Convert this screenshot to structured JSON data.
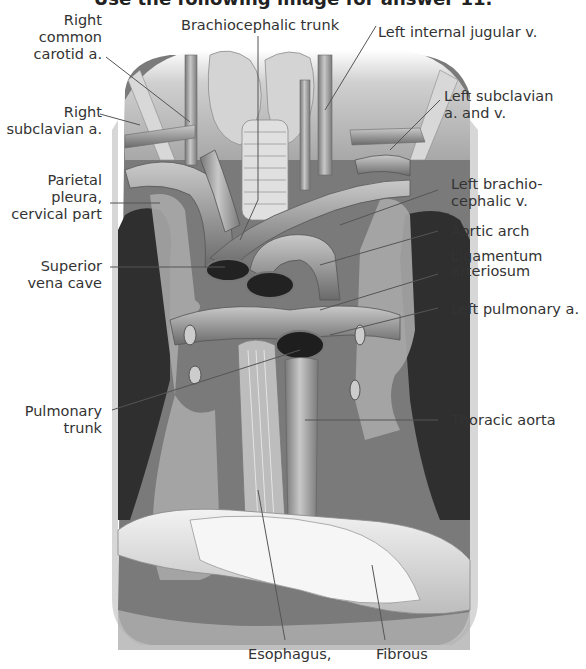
{
  "header": {
    "text": "Use the following image for answer 11."
  },
  "figure": {
    "labels_left": [
      {
        "id": "right-common-carotid",
        "lines": [
          "Right",
          "common",
          "carotid a."
        ]
      },
      {
        "id": "right-subclavian",
        "lines": [
          "Right",
          "subclavian a."
        ]
      },
      {
        "id": "parietal-pleura",
        "lines": [
          "Parietal",
          "pleura,",
          "cervical part"
        ]
      },
      {
        "id": "superior-vena-cava",
        "lines": [
          "Superior",
          "vena cave"
        ]
      },
      {
        "id": "pulmonary-trunk",
        "lines": [
          "Pulmonary",
          "trunk"
        ]
      }
    ],
    "labels_top": [
      {
        "id": "brachiocephalic-trunk",
        "lines": [
          "Brachiocephalic trunk"
        ]
      }
    ],
    "labels_right": [
      {
        "id": "left-internal-jugular",
        "lines": [
          "Left internal jugular v."
        ]
      },
      {
        "id": "left-subclavian",
        "lines": [
          "Left subclavian",
          "a. and v."
        ]
      },
      {
        "id": "left-brachiocephalic",
        "lines": [
          "Left brachio-",
          "cephalic v."
        ]
      },
      {
        "id": "aortic-arch",
        "lines": [
          "Aortic arch"
        ]
      },
      {
        "id": "ligamentum-arteriosum",
        "lines": [
          "Ligamentum",
          "arteriosum"
        ]
      },
      {
        "id": "left-pulmonary",
        "lines": [
          "Left pulmonary a."
        ]
      },
      {
        "id": "thoracic-aorta",
        "lines": [
          "Thoracic aorta"
        ]
      }
    ],
    "labels_bottom": [
      {
        "id": "esophagus",
        "lines": [
          "Esophagus,"
        ]
      },
      {
        "id": "fibrous",
        "lines": [
          "Fibrous"
        ]
      }
    ]
  },
  "colors": {
    "background": "#ffffff",
    "text": "#333333",
    "leader": "#555555",
    "dark_cavity": "#2b2b2b",
    "vessel": "#9a9a9a"
  }
}
